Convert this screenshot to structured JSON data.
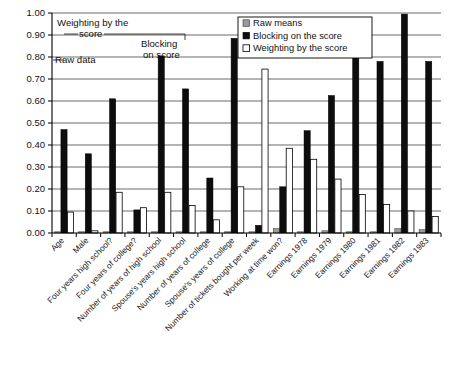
{
  "chart_data": {
    "type": "bar",
    "title": "",
    "subtitle": "",
    "xlabel": "",
    "ylabel": "",
    "ylim": [
      0.0,
      1.0
    ],
    "ytick_labels": [
      "0.00",
      "0.10",
      "0.20",
      "0.30",
      "0.40",
      "0.50",
      "0.60",
      "0.70",
      "0.80",
      "0.90",
      "1.00"
    ],
    "ytick_values": [
      0.0,
      0.1,
      0.2,
      0.3,
      0.4,
      0.5,
      0.6,
      0.7,
      0.8,
      0.9,
      1.0
    ],
    "grid": true,
    "legend_position": "top-right",
    "categories": [
      "Age",
      "Male",
      "Four years high school?",
      "Four years of college?",
      "Number of years of high school",
      "Spouse's years high school",
      "Number of years of college",
      "Spouse's years of college",
      "Number of tickets bought per week",
      "Working at time won?",
      "Earnings 1978",
      "Earnings 1979",
      "Earnings 1980",
      "Earnings 1981",
      "Earnings 1982",
      "Earnings 1983"
    ],
    "series": [
      {
        "name": "Raw means",
        "style": "raw-means",
        "color": "#9a9a9a",
        "values": [
          0.0,
          0.0,
          0.0,
          0.0,
          0.0,
          0.0,
          0.0,
          0.0,
          0.0,
          0.02,
          0.0,
          0.01,
          0.0,
          0.0,
          0.02,
          0.015
        ]
      },
      {
        "name": "Blocking on the score",
        "style": "blocking",
        "color": "#0d0d0d",
        "values": [
          0.47,
          0.36,
          0.61,
          0.105,
          0.805,
          0.655,
          0.25,
          0.885,
          0.035,
          0.21,
          0.465,
          0.625,
          0.8,
          0.78,
          0.995,
          0.78
        ]
      },
      {
        "name": "Weighting by the score",
        "style": "weighting",
        "color": "#ffffff",
        "values": [
          0.095,
          0.01,
          0.185,
          0.115,
          0.185,
          0.125,
          0.06,
          0.21,
          0.745,
          0.385,
          0.335,
          0.245,
          0.175,
          0.13,
          0.1,
          0.075
        ]
      }
    ],
    "annotations": [
      {
        "text": "Raw data",
        "target_category": "Age",
        "target_series": "Raw means"
      },
      {
        "text": "Weighting by the score",
        "target_category": "Four years high school?",
        "target_series": "Weighting by the score"
      },
      {
        "text": "Blocking on score",
        "target_category": "Number of years of high school",
        "target_series": "Blocking on the score"
      }
    ]
  },
  "legend": {
    "items": [
      {
        "label": "Raw means"
      },
      {
        "label": "Blocking on the score"
      },
      {
        "label": "Weighting by the score"
      }
    ]
  },
  "annotation_text": {
    "raw_data": "Raw data",
    "weighting_line1": "Weighting by the",
    "weighting_line2": "score",
    "blocking_line1": "Blocking",
    "blocking_line2": "on score"
  }
}
